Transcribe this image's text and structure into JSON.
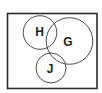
{
  "diagram": {
    "type": "venn",
    "universe": {
      "label": ""
    },
    "sets": [
      {
        "id": "H",
        "label": "H"
      },
      {
        "id": "G",
        "label": "G"
      },
      {
        "id": "J",
        "label": "J"
      }
    ],
    "relationships": [
      {
        "sets": [
          "H",
          "G"
        ],
        "relation": "overlap"
      },
      {
        "sets": [
          "G",
          "J"
        ],
        "relation": "overlap"
      },
      {
        "sets": [
          "H",
          "J"
        ],
        "relation": "touch"
      }
    ],
    "colors": {
      "outline": "#2b2b2b",
      "circle_stroke": "#4a4a4a",
      "label": "#1e1e1e",
      "background": "#ffffff"
    }
  }
}
